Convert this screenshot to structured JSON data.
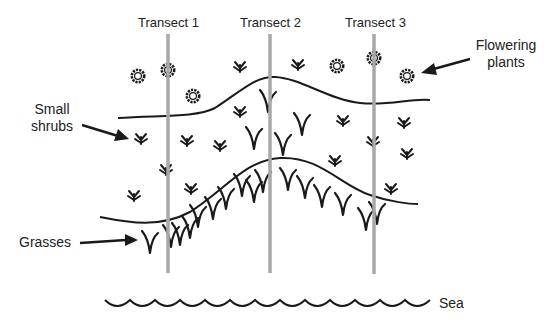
{
  "diagram": {
    "title": "",
    "transects": [
      {
        "label": "Transect 1",
        "x": 168
      },
      {
        "label": "Transect 2",
        "x": 270
      },
      {
        "label": "Transect 3",
        "x": 374
      }
    ],
    "labels": {
      "flowering_plants_line1": "Flowering",
      "flowering_plants_line2": "plants",
      "small_shrubs_line1": "Small",
      "small_shrubs_line2": "shrubs",
      "grasses": "Grasses",
      "sea": "Sea"
    },
    "zones": [
      "Flowering plants",
      "Small shrubs",
      "Grasses",
      "Sea"
    ],
    "colors": {
      "transect_line": "#a8a8a8",
      "ink": "#1a1a1a",
      "background": "#ffffff"
    }
  }
}
